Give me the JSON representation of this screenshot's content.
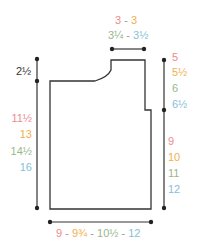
{
  "diagram": {
    "type": "garment schematic",
    "size_colors": [
      "#ee8a8e",
      "#f2b04c",
      "#98b88a",
      "#86c0d8"
    ],
    "line_color": "#333333",
    "shoulder_width_top": {
      "values": [
        "3",
        "3"
      ],
      "separator": "-"
    },
    "shoulder_width_bottom": {
      "values": [
        "3¼",
        "3½"
      ],
      "separator": "-"
    },
    "armhole_depth_left": {
      "value": "2½"
    },
    "right_upper": {
      "values": [
        "5",
        "5½",
        "6",
        "6½"
      ]
    },
    "left_length": {
      "values": [
        "11½",
        "13",
        "14½",
        "16"
      ]
    },
    "right_lower": {
      "values": [
        "9",
        "10",
        "11",
        "12"
      ]
    },
    "bottom_width": {
      "values": [
        "9",
        "9¾",
        "10½",
        "12"
      ],
      "separator": "-"
    }
  }
}
